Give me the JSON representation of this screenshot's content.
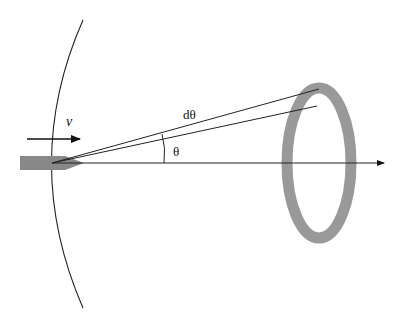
{
  "diagram": {
    "labels": {
      "velocity": "v",
      "dtheta": "dθ",
      "theta": "θ"
    },
    "colors": {
      "line": "#222222",
      "ring": "#999999",
      "projectile": "#888888",
      "background": "#ffffff"
    },
    "elements": [
      "wavefront-arc",
      "velocity-arrow",
      "projectile",
      "cone-lines",
      "angle-arc",
      "axis-arrow",
      "ring"
    ]
  }
}
